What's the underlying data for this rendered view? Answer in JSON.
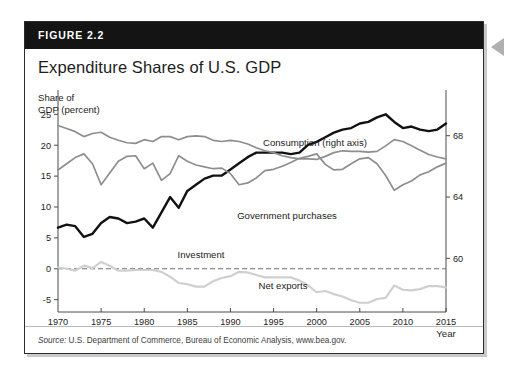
{
  "figure": {
    "label": "FIGURE 2.2",
    "title": "Expenditure Shares of U.S. GDP",
    "y_axis_caption": "Share of\nGDP (percent)",
    "source_prefix": "Source:",
    "source_text": " U.S. Department of Commerce, Bureau of Economic Analysis, www.bea.gov.",
    "arrow_icon": "left-pointing-triangle"
  },
  "colors": {
    "header_band": "#141414",
    "card_border": "#2b2b2b",
    "consumption": "#111111",
    "government": "#8e8e8e",
    "investment": "#8e8e8e",
    "net_exports": "#cfcfcf",
    "zero_line": "#6e6e6e",
    "axis": "#4a4a4a",
    "shadow": "#c9c9c9"
  },
  "chart_data": {
    "type": "line",
    "title": "Expenditure Shares of U.S. GDP",
    "xlabel": "Year",
    "ylabel": "Share of GDP (percent)",
    "xlim": [
      1970,
      2015
    ],
    "ylim": [
      -7,
      27
    ],
    "grid": false,
    "legend": "inline-annotations",
    "x_ticks": [
      1970,
      1975,
      1980,
      1985,
      1990,
      1995,
      2000,
      2005,
      2010,
      2015
    ],
    "y_ticks_left": [
      25,
      20,
      15,
      10,
      5,
      0,
      -5
    ],
    "y_ticks_right": [
      68,
      64,
      60
    ],
    "right_axis_lim": [
      56.5,
      70.2
    ],
    "zero_reference_line": 0,
    "x": [
      1970,
      1971,
      1972,
      1973,
      1974,
      1975,
      1976,
      1977,
      1978,
      1979,
      1980,
      1981,
      1982,
      1983,
      1984,
      1985,
      1986,
      1987,
      1988,
      1989,
      1990,
      1991,
      1992,
      1993,
      1994,
      1995,
      1996,
      1997,
      1998,
      1999,
      2000,
      2001,
      2002,
      2003,
      2004,
      2005,
      2006,
      2007,
      2008,
      2009,
      2010,
      2011,
      2012,
      2013,
      2014,
      2015
    ],
    "series": [
      {
        "name": "Consumption (right axis)",
        "axis": "right",
        "label_text": "Consumption (right axis)",
        "color": "#111111",
        "values": [
          62.0,
          62.2,
          62.1,
          61.4,
          61.6,
          62.3,
          62.7,
          62.6,
          62.3,
          62.4,
          62.6,
          62.0,
          63.0,
          64.0,
          63.3,
          64.4,
          64.8,
          65.2,
          65.4,
          65.4,
          65.8,
          66.2,
          66.6,
          66.9,
          66.9,
          66.9,
          66.9,
          66.8,
          66.9,
          67.4,
          67.6,
          67.9,
          68.2,
          68.4,
          68.5,
          68.8,
          68.9,
          69.2,
          69.4,
          68.9,
          68.5,
          68.6,
          68.4,
          68.3,
          68.4,
          68.8
        ]
      },
      {
        "name": "Government purchases",
        "axis": "left",
        "label_text": "Government purchases",
        "color": "#8e8e8e",
        "values": [
          23.2,
          22.7,
          22.2,
          21.4,
          21.9,
          22.1,
          21.3,
          20.8,
          20.4,
          20.3,
          20.9,
          20.6,
          21.4,
          21.4,
          20.9,
          21.4,
          21.5,
          21.4,
          20.8,
          20.6,
          20.8,
          20.6,
          20.2,
          19.6,
          19.1,
          18.8,
          18.3,
          18.0,
          17.8,
          17.8,
          17.7,
          18.2,
          18.8,
          19.1,
          19.0,
          19.0,
          18.9,
          19.0,
          19.9,
          20.9,
          20.6,
          19.9,
          19.2,
          18.5,
          18.1,
          17.8
        ]
      },
      {
        "name": "Investment",
        "axis": "left",
        "label_text": "Investment",
        "color": "#8e8e8e",
        "values": [
          16.0,
          17.0,
          18.0,
          18.6,
          17.0,
          13.6,
          15.5,
          17.4,
          18.2,
          18.3,
          16.2,
          17.1,
          14.3,
          15.4,
          18.3,
          17.4,
          16.8,
          16.5,
          16.2,
          16.3,
          15.4,
          13.6,
          13.9,
          14.7,
          15.9,
          16.1,
          16.6,
          17.2,
          17.9,
          18.2,
          18.6,
          16.9,
          16.0,
          16.1,
          17.0,
          17.8,
          18.0,
          17.0,
          15.1,
          12.7,
          13.6,
          14.2,
          15.2,
          15.7,
          16.5,
          17.1
        ]
      },
      {
        "name": "Net exports",
        "axis": "left",
        "label_text": "Net exports",
        "color": "#cfcfcf",
        "values": [
          0.2,
          0.0,
          -0.3,
          0.5,
          0.1,
          1.1,
          0.5,
          -0.3,
          -0.3,
          -0.2,
          -0.2,
          -0.2,
          -0.5,
          -1.3,
          -2.3,
          -2.5,
          -2.9,
          -2.9,
          -2.0,
          -1.5,
          -1.2,
          -0.5,
          -0.6,
          -1.0,
          -1.4,
          -1.4,
          -1.4,
          -1.4,
          -1.9,
          -2.7,
          -3.8,
          -3.6,
          -4.1,
          -4.5,
          -5.1,
          -5.5,
          -5.5,
          -4.9,
          -4.7,
          -2.7,
          -3.4,
          -3.5,
          -3.3,
          -2.8,
          -2.8,
          -3.0
        ]
      }
    ]
  }
}
